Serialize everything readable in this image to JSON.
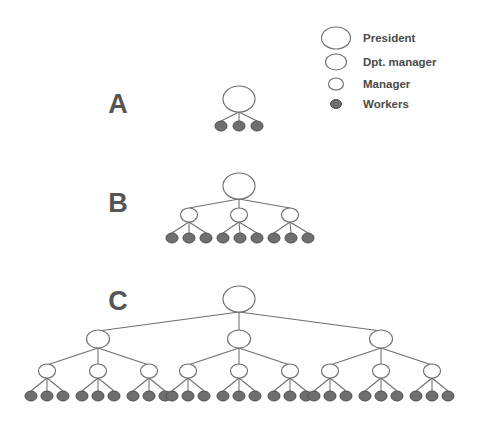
{
  "figure": {
    "background_color": "#ffffff",
    "width": 481,
    "height": 425,
    "node_colors": {
      "open_fill": "#ffffff",
      "open_stroke": "#6e6e6e",
      "worker_fill": "#6f6f6f",
      "worker_stroke": "#4f4f4f",
      "edge": "#6e6e6e",
      "label_text": "#555555",
      "legend_text": "#4a4a4a"
    }
  },
  "legend": {
    "name": "node-type-legend",
    "items": [
      {
        "label": "President",
        "symbol": "ellipse-open",
        "rx": 14.5,
        "ry": 11.0,
        "cx": 336,
        "cy": 38,
        "text_x": 363,
        "text_y": 42
      },
      {
        "label": "Dpt. manager",
        "symbol": "ellipse-open",
        "rx": 10.5,
        "ry": 8.0,
        "cx": 336,
        "cy": 62,
        "text_x": 363,
        "text_y": 66
      },
      {
        "label": "Manager",
        "symbol": "ellipse-open",
        "rx": 7.5,
        "ry": 6.0,
        "cx": 336,
        "cy": 84,
        "text_x": 363,
        "text_y": 88
      },
      {
        "label": "Workers",
        "symbol": "ellipse-filled",
        "rx": 5.5,
        "ry": 4.5,
        "cx": 336,
        "cy": 104,
        "text_x": 363,
        "text_y": 108
      }
    ]
  },
  "structures": [
    {
      "id": "A",
      "label": "A",
      "label_x": 118,
      "label_y": 113,
      "levels": [
        "President",
        "Workers"
      ],
      "counts": {
        "president": 1,
        "dpt_managers": 0,
        "managers": 0,
        "workers": 3
      },
      "total_nodes": 4,
      "president": {
        "cx": 239,
        "cy": 99,
        "rx": 16.0,
        "ry": 13.0
      },
      "workers": [
        {
          "cx": 221,
          "cy": 126,
          "rx": 6.0,
          "ry": 5.0
        },
        {
          "cx": 239,
          "cy": 126,
          "rx": 6.0,
          "ry": 5.0
        },
        {
          "cx": 257,
          "cy": 126,
          "rx": 6.0,
          "ry": 5.0
        }
      ],
      "edges": [
        {
          "x1": 239,
          "y1": 112,
          "x2": 221,
          "y2": 121
        },
        {
          "x1": 239,
          "y1": 112,
          "x2": 239,
          "y2": 121
        },
        {
          "x1": 239,
          "y1": 112,
          "x2": 257,
          "y2": 121
        }
      ]
    },
    {
      "id": "B",
      "label": "B",
      "label_x": 118,
      "label_y": 212,
      "levels": [
        "President",
        "Manager",
        "Workers"
      ],
      "counts": {
        "president": 1,
        "dpt_managers": 0,
        "managers": 3,
        "workers": 9
      },
      "total_nodes": 13,
      "president": {
        "cx": 239,
        "cy": 186,
        "rx": 16.0,
        "ry": 13.0
      },
      "managers": [
        {
          "cx": 189,
          "cy": 215,
          "rx": 8.5,
          "ry": 7.0
        },
        {
          "cx": 239,
          "cy": 215,
          "rx": 8.5,
          "ry": 7.0
        },
        {
          "cx": 290,
          "cy": 215,
          "rx": 8.5,
          "ry": 7.0
        }
      ],
      "workers": [
        {
          "cx": 172,
          "cy": 238,
          "rx": 6.0,
          "ry": 5.0
        },
        {
          "cx": 189,
          "cy": 238,
          "rx": 6.0,
          "ry": 5.0
        },
        {
          "cx": 206,
          "cy": 238,
          "rx": 6.0,
          "ry": 5.0
        },
        {
          "cx": 223,
          "cy": 238,
          "rx": 6.0,
          "ry": 5.0
        },
        {
          "cx": 240,
          "cy": 238,
          "rx": 6.0,
          "ry": 5.0
        },
        {
          "cx": 257,
          "cy": 238,
          "rx": 6.0,
          "ry": 5.0
        },
        {
          "cx": 274,
          "cy": 238,
          "rx": 6.0,
          "ry": 5.0
        },
        {
          "cx": 291,
          "cy": 238,
          "rx": 6.0,
          "ry": 5.0
        },
        {
          "cx": 308,
          "cy": 238,
          "rx": 6.0,
          "ry": 5.0
        }
      ],
      "edges": [
        {
          "x1": 239,
          "y1": 199,
          "x2": 189,
          "y2": 208
        },
        {
          "x1": 239,
          "y1": 199,
          "x2": 239,
          "y2": 208
        },
        {
          "x1": 239,
          "y1": 199,
          "x2": 290,
          "y2": 208
        },
        {
          "x1": 189,
          "y1": 222,
          "x2": 172,
          "y2": 233
        },
        {
          "x1": 189,
          "y1": 222,
          "x2": 189,
          "y2": 233
        },
        {
          "x1": 189,
          "y1": 222,
          "x2": 206,
          "y2": 233
        },
        {
          "x1": 239,
          "y1": 222,
          "x2": 223,
          "y2": 233
        },
        {
          "x1": 239,
          "y1": 222,
          "x2": 240,
          "y2": 233
        },
        {
          "x1": 239,
          "y1": 222,
          "x2": 257,
          "y2": 233
        },
        {
          "x1": 290,
          "y1": 222,
          "x2": 274,
          "y2": 233
        },
        {
          "x1": 290,
          "y1": 222,
          "x2": 291,
          "y2": 233
        },
        {
          "x1": 290,
          "y1": 222,
          "x2": 308,
          "y2": 233
        }
      ]
    },
    {
      "id": "C",
      "label": "C",
      "label_x": 118,
      "label_y": 310,
      "levels": [
        "President",
        "Dpt. manager",
        "Manager",
        "Workers"
      ],
      "counts": {
        "president": 1,
        "dpt_managers": 3,
        "managers": 9,
        "workers": 27
      },
      "total_nodes": 40,
      "president": {
        "cx": 239,
        "cy": 299,
        "rx": 16.0,
        "ry": 13.0
      },
      "dpt_managers": [
        {
          "cx": 98,
          "cy": 339,
          "rx": 11.5,
          "ry": 9.0
        },
        {
          "cx": 239,
          "cy": 339,
          "rx": 11.5,
          "ry": 9.0
        },
        {
          "cx": 381,
          "cy": 339,
          "rx": 11.5,
          "ry": 9.0
        }
      ],
      "managers": [
        {
          "cx": 47,
          "cy": 371,
          "rx": 8.5,
          "ry": 7.0
        },
        {
          "cx": 98,
          "cy": 371,
          "rx": 8.5,
          "ry": 7.0
        },
        {
          "cx": 149,
          "cy": 371,
          "rx": 8.5,
          "ry": 7.0
        },
        {
          "cx": 188,
          "cy": 371,
          "rx": 8.5,
          "ry": 7.0
        },
        {
          "cx": 239,
          "cy": 371,
          "rx": 8.5,
          "ry": 7.0
        },
        {
          "cx": 290,
          "cy": 371,
          "rx": 8.5,
          "ry": 7.0
        },
        {
          "cx": 330,
          "cy": 371,
          "rx": 8.5,
          "ry": 7.0
        },
        {
          "cx": 381,
          "cy": 371,
          "rx": 8.5,
          "ry": 7.0
        },
        {
          "cx": 432,
          "cy": 371,
          "rx": 8.5,
          "ry": 7.0
        }
      ],
      "workers": [
        {
          "cx": 31,
          "cy": 396,
          "rx": 6.0,
          "ry": 5.0
        },
        {
          "cx": 47,
          "cy": 396,
          "rx": 6.0,
          "ry": 5.0
        },
        {
          "cx": 63,
          "cy": 396,
          "rx": 6.0,
          "ry": 5.0
        },
        {
          "cx": 82,
          "cy": 396,
          "rx": 6.0,
          "ry": 5.0
        },
        {
          "cx": 98,
          "cy": 396,
          "rx": 6.0,
          "ry": 5.0
        },
        {
          "cx": 114,
          "cy": 396,
          "rx": 6.0,
          "ry": 5.0
        },
        {
          "cx": 133,
          "cy": 396,
          "rx": 6.0,
          "ry": 5.0
        },
        {
          "cx": 149,
          "cy": 396,
          "rx": 6.0,
          "ry": 5.0
        },
        {
          "cx": 165,
          "cy": 396,
          "rx": 6.0,
          "ry": 5.0
        },
        {
          "cx": 172,
          "cy": 396,
          "rx": 6.0,
          "ry": 5.0
        },
        {
          "cx": 188,
          "cy": 396,
          "rx": 6.0,
          "ry": 5.0
        },
        {
          "cx": 204,
          "cy": 396,
          "rx": 6.0,
          "ry": 5.0
        },
        {
          "cx": 223,
          "cy": 396,
          "rx": 6.0,
          "ry": 5.0
        },
        {
          "cx": 239,
          "cy": 396,
          "rx": 6.0,
          "ry": 5.0
        },
        {
          "cx": 255,
          "cy": 396,
          "rx": 6.0,
          "ry": 5.0
        },
        {
          "cx": 274,
          "cy": 396,
          "rx": 6.0,
          "ry": 5.0
        },
        {
          "cx": 290,
          "cy": 396,
          "rx": 6.0,
          "ry": 5.0
        },
        {
          "cx": 306,
          "cy": 396,
          "rx": 6.0,
          "ry": 5.0
        },
        {
          "cx": 314,
          "cy": 396,
          "rx": 6.0,
          "ry": 5.0
        },
        {
          "cx": 330,
          "cy": 396,
          "rx": 6.0,
          "ry": 5.0
        },
        {
          "cx": 346,
          "cy": 396,
          "rx": 6.0,
          "ry": 5.0
        },
        {
          "cx": 365,
          "cy": 396,
          "rx": 6.0,
          "ry": 5.0
        },
        {
          "cx": 381,
          "cy": 396,
          "rx": 6.0,
          "ry": 5.0
        },
        {
          "cx": 397,
          "cy": 396,
          "rx": 6.0,
          "ry": 5.0
        },
        {
          "cx": 416,
          "cy": 396,
          "rx": 6.0,
          "ry": 5.0
        },
        {
          "cx": 432,
          "cy": 396,
          "rx": 6.0,
          "ry": 5.0
        },
        {
          "cx": 448,
          "cy": 396,
          "rx": 6.0,
          "ry": 5.0
        }
      ],
      "edges": [
        {
          "x1": 239,
          "y1": 312,
          "x2": 98,
          "y2": 331
        },
        {
          "x1": 239,
          "y1": 312,
          "x2": 239,
          "y2": 331
        },
        {
          "x1": 239,
          "y1": 312,
          "x2": 381,
          "y2": 331
        },
        {
          "x1": 98,
          "y1": 348,
          "x2": 47,
          "y2": 365
        },
        {
          "x1": 98,
          "y1": 348,
          "x2": 98,
          "y2": 365
        },
        {
          "x1": 98,
          "y1": 348,
          "x2": 149,
          "y2": 365
        },
        {
          "x1": 239,
          "y1": 348,
          "x2": 188,
          "y2": 365
        },
        {
          "x1": 239,
          "y1": 348,
          "x2": 239,
          "y2": 365
        },
        {
          "x1": 239,
          "y1": 348,
          "x2": 290,
          "y2": 365
        },
        {
          "x1": 381,
          "y1": 348,
          "x2": 330,
          "y2": 365
        },
        {
          "x1": 381,
          "y1": 348,
          "x2": 381,
          "y2": 365
        },
        {
          "x1": 381,
          "y1": 348,
          "x2": 432,
          "y2": 365
        },
        {
          "x1": 47,
          "y1": 378,
          "x2": 31,
          "y2": 391
        },
        {
          "x1": 47,
          "y1": 378,
          "x2": 47,
          "y2": 391
        },
        {
          "x1": 47,
          "y1": 378,
          "x2": 63,
          "y2": 391
        },
        {
          "x1": 98,
          "y1": 378,
          "x2": 82,
          "y2": 391
        },
        {
          "x1": 98,
          "y1": 378,
          "x2": 98,
          "y2": 391
        },
        {
          "x1": 98,
          "y1": 378,
          "x2": 114,
          "y2": 391
        },
        {
          "x1": 149,
          "y1": 378,
          "x2": 133,
          "y2": 391
        },
        {
          "x1": 149,
          "y1": 378,
          "x2": 149,
          "y2": 391
        },
        {
          "x1": 149,
          "y1": 378,
          "x2": 165,
          "y2": 391
        },
        {
          "x1": 188,
          "y1": 378,
          "x2": 172,
          "y2": 391
        },
        {
          "x1": 188,
          "y1": 378,
          "x2": 188,
          "y2": 391
        },
        {
          "x1": 188,
          "y1": 378,
          "x2": 204,
          "y2": 391
        },
        {
          "x1": 239,
          "y1": 378,
          "x2": 223,
          "y2": 391
        },
        {
          "x1": 239,
          "y1": 378,
          "x2": 239,
          "y2": 391
        },
        {
          "x1": 239,
          "y1": 378,
          "x2": 255,
          "y2": 391
        },
        {
          "x1": 290,
          "y1": 378,
          "x2": 274,
          "y2": 391
        },
        {
          "x1": 290,
          "y1": 378,
          "x2": 290,
          "y2": 391
        },
        {
          "x1": 290,
          "y1": 378,
          "x2": 306,
          "y2": 391
        },
        {
          "x1": 330,
          "y1": 378,
          "x2": 314,
          "y2": 391
        },
        {
          "x1": 330,
          "y1": 378,
          "x2": 330,
          "y2": 391
        },
        {
          "x1": 330,
          "y1": 378,
          "x2": 346,
          "y2": 391
        },
        {
          "x1": 381,
          "y1": 378,
          "x2": 365,
          "y2": 391
        },
        {
          "x1": 381,
          "y1": 378,
          "x2": 381,
          "y2": 391
        },
        {
          "x1": 381,
          "y1": 378,
          "x2": 397,
          "y2": 391
        },
        {
          "x1": 432,
          "y1": 378,
          "x2": 416,
          "y2": 391
        },
        {
          "x1": 432,
          "y1": 378,
          "x2": 432,
          "y2": 391
        },
        {
          "x1": 432,
          "y1": 378,
          "x2": 448,
          "y2": 391
        }
      ]
    }
  ]
}
